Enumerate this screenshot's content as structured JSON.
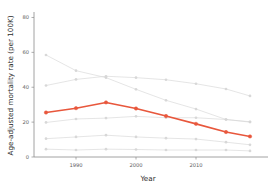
{
  "chart_data": {
    "type": "line",
    "title": "",
    "xlabel": "Year",
    "ylabel": "Age-adjusted mortality rate (per 100K)",
    "x": [
      1985,
      1990,
      1995,
      2000,
      2005,
      2010,
      2015,
      2019
    ],
    "xlim": [
      1983,
      2021
    ],
    "ylim": [
      0,
      82
    ],
    "xticks": [
      1990,
      2000,
      2010
    ],
    "xticklabels": [
      "1990",
      "2000",
      "2010"
    ],
    "yticks": [
      0,
      20,
      40,
      60,
      80
    ],
    "yticklabels": [
      "0",
      "20",
      "40",
      "60",
      "80"
    ],
    "grid": false,
    "legend": "none",
    "highlight_color": "#e8573c",
    "muted_color": "#d6d6d6",
    "series": [
      {
        "name": "series-1-declining-high",
        "color": "#d6d6d6",
        "highlighted": false,
        "values": [
          58.5,
          49.5,
          45.5,
          38.8,
          32.5,
          27.5,
          21.5,
          20.2
        ]
      },
      {
        "name": "series-2-slow-decline",
        "color": "#d6d6d6",
        "highlighted": false,
        "values": [
          41.0,
          44.5,
          46.3,
          45.5,
          44.3,
          42.0,
          39.0,
          35.0
        ]
      },
      {
        "name": "series-3-highlighted",
        "color": "#e8573c",
        "highlighted": true,
        "values": [
          25.5,
          28.0,
          31.3,
          27.8,
          23.5,
          19.0,
          14.3,
          11.8
        ]
      },
      {
        "name": "series-4-low-flat",
        "color": "#d6d6d6",
        "highlighted": false,
        "values": [
          19.8,
          21.8,
          22.3,
          23.3,
          22.5,
          22.5,
          21.5,
          20.0
        ]
      },
      {
        "name": "series-5-lower-flat",
        "color": "#d6d6d6",
        "highlighted": false,
        "values": [
          10.5,
          11.5,
          12.5,
          11.5,
          10.8,
          10.3,
          8.5,
          7.0
        ]
      },
      {
        "name": "series-6-lowest-flat",
        "color": "#d6d6d6",
        "highlighted": false,
        "values": [
          4.5,
          4.0,
          4.5,
          4.3,
          4.0,
          4.0,
          4.0,
          3.5
        ]
      }
    ]
  },
  "axes": {
    "xlabel": "Year",
    "ylabel": "Age-adjusted mortality rate (per 100K)"
  }
}
